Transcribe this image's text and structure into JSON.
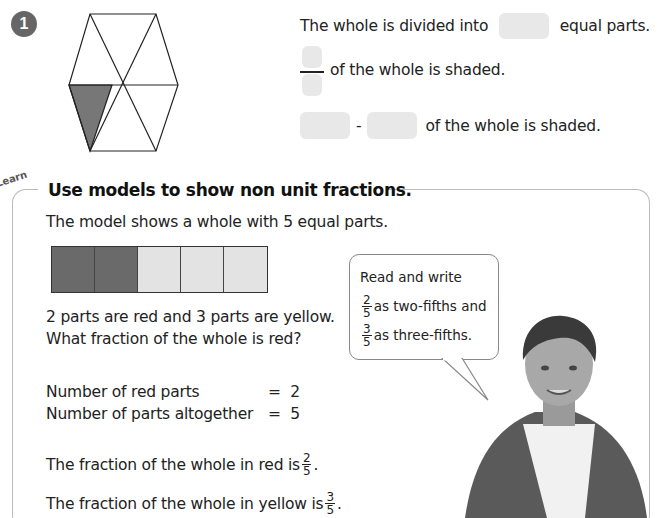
{
  "exercise": {
    "number": "1",
    "hexagon": {
      "total_parts": 6,
      "shaded_parts": 1,
      "shaded_color": "#777777"
    },
    "line1": {
      "before": "The whole is divided into",
      "after": "equal parts."
    },
    "line2": {
      "after": "of the whole is shaded."
    },
    "line3": {
      "dash": "-",
      "after": "of the whole is shaded."
    }
  },
  "learn": {
    "tag": "Learn",
    "heading": "Use models to show non unit fractions.",
    "intro": "The model shows a whole with 5 equal parts.",
    "bar_model": {
      "parts": [
        "red",
        "red",
        "yellow",
        "yellow",
        "yellow"
      ],
      "colors": {
        "red": "#6a6a6a",
        "yellow": "#e3e3e3"
      }
    },
    "question_line1": "2 parts are red and 3 parts are yellow.",
    "question_line2": "What fraction of the whole is red?",
    "equations": [
      {
        "label": "Number of red parts",
        "sign": "=",
        "value": "2"
      },
      {
        "label": "Number of parts altogether",
        "sign": "=",
        "value": "5"
      }
    ],
    "result_red": {
      "text": "The fraction of the whole in red is",
      "num": "2",
      "den": "5",
      "end": "."
    },
    "result_yellow": {
      "text": "The fraction of the whole in yellow is",
      "num": "3",
      "den": "5",
      "end": "."
    },
    "speech_bubble": {
      "line1": "Read and write",
      "line2": {
        "num": "2",
        "den": "5",
        "text": "as two-fifths and"
      },
      "line3": {
        "num": "3",
        "den": "5",
        "text": "as three-fifths."
      }
    }
  }
}
